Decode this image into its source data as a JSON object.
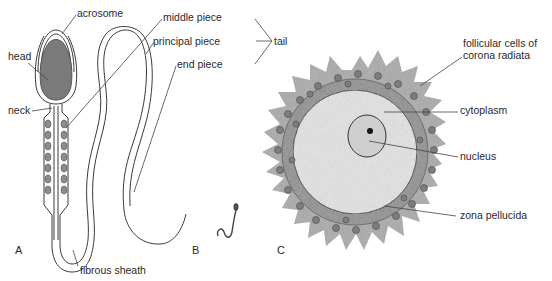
{
  "figure": {
    "panels": [
      {
        "id": "A",
        "letter": "A",
        "subject": "human spermatozoon (detailed)"
      },
      {
        "id": "B",
        "letter": "B",
        "subject": "spermatozoon outline / relative scale"
      },
      {
        "id": "C",
        "letter": "C",
        "subject": "ovum with corona radiata"
      }
    ],
    "labels": {
      "acrosome": "acrosome",
      "head": "head",
      "neck": "neck",
      "middle_piece": "middle piece",
      "principal_piece": "principal piece",
      "end_piece": "end piece",
      "tail": "tail",
      "fibrous_sheath": "fibrous sheath",
      "follicular_line1": "follicular cells of",
      "follicular_line2": "corona radiata",
      "cytoplasm": "cytoplasm",
      "nucleus": "nucleus",
      "zona_pellucida": "zona pellucida"
    },
    "colors": {
      "line": "#3a3a3a",
      "head_fill": "#7a7a7a",
      "mito_fill": "#8c8c8c",
      "corona": "#a9a9a9",
      "zona": "#8e8e8e",
      "cytoplasm": "#e4e4e4",
      "nucleus": "#cfcfcf",
      "nucleolus": "#111111"
    }
  }
}
